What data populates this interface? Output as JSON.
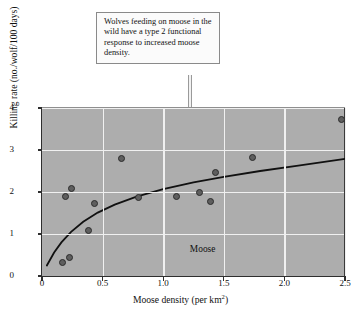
{
  "callout": {
    "text": "Wolves feeding on moose in the wild have a type 2 functional response to increased moose density."
  },
  "chart_data": {
    "type": "scatter",
    "title": "",
    "xlabel": "Moose density (per km2)",
    "xlabel_main": "Moose density (per km",
    "xlabel_sup": "2",
    "xlabel_tail": ")",
    "ylabel": "Killing rate (no./wolf/100 days)",
    "xlim": [
      0,
      2.5
    ],
    "ylim": [
      0,
      4
    ],
    "xticks": [
      0,
      0.5,
      1.0,
      1.5,
      2.0,
      2.5
    ],
    "xtick_labels": [
      "0",
      "0.5",
      "1.0",
      "1.5",
      "2.0",
      "2.5"
    ],
    "yticks": [
      0,
      1,
      2,
      3,
      4
    ],
    "ytick_labels": [
      "0",
      "1",
      "2",
      "3",
      "4"
    ],
    "grid": true,
    "legend": "none",
    "series_annotation": "Moose",
    "series_annotation_x": 1.22,
    "series_annotation_y": 0.62,
    "points": [
      {
        "x": 0.17,
        "y": 0.33
      },
      {
        "x": 0.23,
        "y": 0.43
      },
      {
        "x": 0.19,
        "y": 1.89
      },
      {
        "x": 0.24,
        "y": 2.08
      },
      {
        "x": 0.38,
        "y": 1.09
      },
      {
        "x": 0.43,
        "y": 1.73
      },
      {
        "x": 0.66,
        "y": 2.79
      },
      {
        "x": 0.8,
        "y": 1.87
      },
      {
        "x": 1.11,
        "y": 1.89
      },
      {
        "x": 1.3,
        "y": 1.98
      },
      {
        "x": 1.39,
        "y": 1.78
      },
      {
        "x": 1.43,
        "y": 2.47
      },
      {
        "x": 1.74,
        "y": 2.81
      },
      {
        "x": 2.47,
        "y": 3.72
      }
    ],
    "fit_curve": {
      "model": "type 2 functional response",
      "description": "Hyperbolic saturating curve",
      "points": [
        {
          "x": 0.04,
          "y": 0.25
        },
        {
          "x": 0.1,
          "y": 0.56
        },
        {
          "x": 0.16,
          "y": 0.8
        },
        {
          "x": 0.24,
          "y": 1.05
        },
        {
          "x": 0.34,
          "y": 1.29
        },
        {
          "x": 0.46,
          "y": 1.51
        },
        {
          "x": 0.6,
          "y": 1.7
        },
        {
          "x": 0.78,
          "y": 1.89
        },
        {
          "x": 1.0,
          "y": 2.07
        },
        {
          "x": 1.25,
          "y": 2.23
        },
        {
          "x": 1.5,
          "y": 2.36
        },
        {
          "x": 1.8,
          "y": 2.5
        },
        {
          "x": 2.1,
          "y": 2.62
        },
        {
          "x": 2.5,
          "y": 2.79
        }
      ]
    },
    "colors": {
      "plot_background": "#adadad",
      "gridline": "#f0f0f0",
      "marker_fill": "#5e5e5e",
      "marker_edge": "#2b2b2b",
      "curve": "#111111",
      "axis": "#2e2e2e",
      "page_background": "#ffffff"
    }
  }
}
